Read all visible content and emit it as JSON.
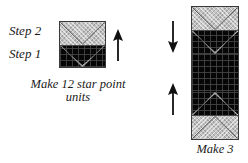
{
  "figure": {
    "type": "quilting-instruction-diagram",
    "background_color": "#ffffff",
    "ink_color": "#1a1a1a"
  },
  "left_panel": {
    "step_labels": [
      {
        "id": "step-2",
        "text": "Step 2"
      },
      {
        "id": "step-1",
        "text": "Step 1"
      }
    ],
    "caption": "Make 12 star point units",
    "unit": {
      "name": "star-point-unit",
      "shape": "square",
      "top_half": {
        "fabric": "light",
        "motif": "v-seam-chevron",
        "color": "#c3c3c3"
      },
      "bottom_half": {
        "fabric": "dark",
        "motif": "light-down-chevron",
        "background_color": "#060606",
        "motif_color": "#c3c3c3"
      }
    },
    "arrow": {
      "name": "press-direction-arrow",
      "direction": "up",
      "color": "#111111"
    }
  },
  "right_panel": {
    "caption": "Make 3",
    "unit": {
      "name": "stacked-star-point-rectangle",
      "shape": "vertical-rectangle",
      "top_block": "star-point-unit",
      "bottom_block": "star-point-unit-flipped",
      "center_fabric": "dark",
      "center_color": "#060606",
      "light_color": "#c3c3c3"
    },
    "arrows": [
      {
        "name": "press-direction-arrow-down",
        "direction": "down",
        "color": "#111111"
      },
      {
        "name": "press-direction-arrow-up",
        "direction": "up",
        "color": "#111111"
      }
    ]
  }
}
